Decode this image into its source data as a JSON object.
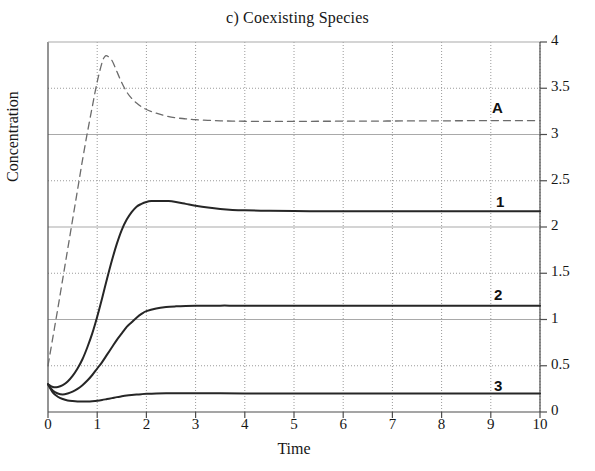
{
  "chart_data": {
    "type": "line",
    "title": "c) Coexisting Species",
    "xlabel": "Time",
    "ylabel": "Concentration",
    "xlim": [
      0,
      10
    ],
    "ylim": [
      0,
      4
    ],
    "xticks": [
      "0",
      "1",
      "2",
      "3",
      "4",
      "5",
      "6",
      "7",
      "8",
      "9",
      "10"
    ],
    "yticks": [
      "0",
      "0.5",
      "1",
      "1.5",
      "2",
      "2.5",
      "3",
      "3.5",
      "4"
    ],
    "y_axis_position": "right",
    "grid": {
      "horizontal_solid_at": [
        1,
        2,
        3
      ],
      "horizontal_dotted_at": [
        0.5,
        1.5,
        2.5,
        3.5
      ],
      "vertical_dotted_at": [
        1,
        2,
        3,
        4,
        5,
        6,
        7,
        8,
        9,
        10
      ],
      "grid_color": "#b8b8b8"
    },
    "legend_position": "inline-right-of-curve",
    "series": [
      {
        "name": "A",
        "label": "A",
        "style": "dashed",
        "color": "#6b6b6b",
        "width": 1.3,
        "steady_state": 3.15,
        "peak": {
          "x": 1.15,
          "y": 3.85
        },
        "x": [
          0,
          0.1,
          0.2,
          0.3,
          0.4,
          0.5,
          0.6,
          0.7,
          0.8,
          0.9,
          1.0,
          1.1,
          1.15,
          1.2,
          1.3,
          1.4,
          1.5,
          1.6,
          1.7,
          1.8,
          1.9,
          2.0,
          2.2,
          2.4,
          2.6,
          2.8,
          3.0,
          3.25,
          3.5,
          3.75,
          4.0,
          4.5,
          5.0,
          5.5,
          6.0,
          6.5,
          7.0,
          7.5,
          8.0,
          8.5,
          9.0,
          9.5,
          10.0
        ],
        "y": [
          0.5,
          0.81,
          1.12,
          1.44,
          1.76,
          2.08,
          2.4,
          2.72,
          3.02,
          3.3,
          3.57,
          3.78,
          3.84,
          3.85,
          3.8,
          3.68,
          3.56,
          3.46,
          3.39,
          3.34,
          3.3,
          3.27,
          3.23,
          3.2,
          3.18,
          3.17,
          3.16,
          3.153,
          3.148,
          3.145,
          3.143,
          3.142,
          3.142,
          3.143,
          3.144,
          3.145,
          3.146,
          3.147,
          3.148,
          3.149,
          3.15,
          3.15,
          3.15
        ]
      },
      {
        "name": "1",
        "label": "1",
        "style": "solid",
        "color": "#262626",
        "width": 2.0,
        "steady_state": 2.17,
        "peak": {
          "x": 2.45,
          "y": 2.28
        },
        "x": [
          0,
          0.1,
          0.2,
          0.3,
          0.4,
          0.5,
          0.6,
          0.7,
          0.8,
          0.9,
          1.0,
          1.1,
          1.2,
          1.3,
          1.4,
          1.5,
          1.6,
          1.7,
          1.8,
          1.9,
          2.0,
          2.1,
          2.2,
          2.3,
          2.45,
          2.6,
          2.8,
          3.0,
          3.25,
          3.5,
          3.75,
          4.0,
          4.5,
          5.0,
          5.5,
          6.0,
          6.5,
          7.0,
          7.5,
          8.0,
          8.5,
          9.0,
          9.5,
          10.0
        ],
        "y": [
          0.3,
          0.27,
          0.27,
          0.29,
          0.33,
          0.39,
          0.47,
          0.57,
          0.7,
          0.85,
          1.03,
          1.23,
          1.44,
          1.64,
          1.82,
          1.97,
          2.08,
          2.16,
          2.22,
          2.25,
          2.27,
          2.28,
          2.28,
          2.28,
          2.28,
          2.27,
          2.25,
          2.23,
          2.21,
          2.195,
          2.185,
          2.18,
          2.175,
          2.172,
          2.171,
          2.17,
          2.17,
          2.17,
          2.17,
          2.17,
          2.17,
          2.17,
          2.17,
          2.17
        ]
      },
      {
        "name": "2",
        "label": "2",
        "style": "solid",
        "color": "#262626",
        "width": 2.0,
        "steady_state": 1.15,
        "x": [
          0,
          0.1,
          0.2,
          0.3,
          0.4,
          0.5,
          0.6,
          0.7,
          0.8,
          0.9,
          1.0,
          1.1,
          1.2,
          1.3,
          1.4,
          1.5,
          1.6,
          1.7,
          1.8,
          1.9,
          2.0,
          2.2,
          2.4,
          2.6,
          2.8,
          3.0,
          3.25,
          3.5,
          3.75,
          4.0,
          4.5,
          5.0,
          5.5,
          6.0,
          6.5,
          7.0,
          7.5,
          8.0,
          8.5,
          9.0,
          9.5,
          10.0
        ],
        "y": [
          0.3,
          0.23,
          0.2,
          0.19,
          0.2,
          0.22,
          0.25,
          0.29,
          0.34,
          0.4,
          0.47,
          0.54,
          0.62,
          0.7,
          0.78,
          0.85,
          0.92,
          0.97,
          1.02,
          1.06,
          1.09,
          1.12,
          1.135,
          1.142,
          1.146,
          1.148,
          1.149,
          1.15,
          1.15,
          1.15,
          1.15,
          1.15,
          1.15,
          1.15,
          1.15,
          1.15,
          1.15,
          1.15,
          1.15,
          1.15,
          1.15,
          1.15
        ]
      },
      {
        "name": "3",
        "label": "3",
        "style": "solid",
        "color": "#262626",
        "width": 2.0,
        "steady_state": 0.2,
        "min": {
          "x": 0.8,
          "y": 0.115
        },
        "x": [
          0,
          0.1,
          0.2,
          0.3,
          0.4,
          0.5,
          0.6,
          0.7,
          0.8,
          0.9,
          1.0,
          1.1,
          1.2,
          1.3,
          1.4,
          1.5,
          1.6,
          1.7,
          1.8,
          1.9,
          2.0,
          2.2,
          2.4,
          2.6,
          2.8,
          3.0,
          3.5,
          4.0,
          4.5,
          5.0,
          5.5,
          6.0,
          6.5,
          7.0,
          7.5,
          8.0,
          8.5,
          9.0,
          9.5,
          10.0
        ],
        "y": [
          0.3,
          0.21,
          0.165,
          0.14,
          0.125,
          0.118,
          0.114,
          0.113,
          0.114,
          0.117,
          0.122,
          0.13,
          0.14,
          0.15,
          0.161,
          0.17,
          0.178,
          0.184,
          0.189,
          0.193,
          0.196,
          0.2,
          0.202,
          0.203,
          0.203,
          0.203,
          0.202,
          0.201,
          0.2,
          0.2,
          0.2,
          0.2,
          0.2,
          0.2,
          0.2,
          0.2,
          0.2,
          0.2,
          0.2,
          0.2
        ]
      }
    ]
  },
  "labels": {
    "series_A": "A",
    "series_1": "1",
    "series_2": "2",
    "series_3": "3"
  },
  "ticks": {
    "y": [
      "4",
      "3.5",
      "3",
      "2.5",
      "2",
      "1.5",
      "1",
      "0.5",
      "0"
    ],
    "x": [
      "0",
      "1",
      "2",
      "3",
      "4",
      "5",
      "6",
      "7",
      "8",
      "9",
      "10"
    ]
  },
  "colors": {
    "axis": "#4d4d4d",
    "grid_solid": "#a9a9a9",
    "grid_dotted": "#9a9a9a",
    "curve_solid": "#262626",
    "curve_dashed": "#6b6b6b",
    "text": "#161616",
    "background": "#ffffff"
  }
}
